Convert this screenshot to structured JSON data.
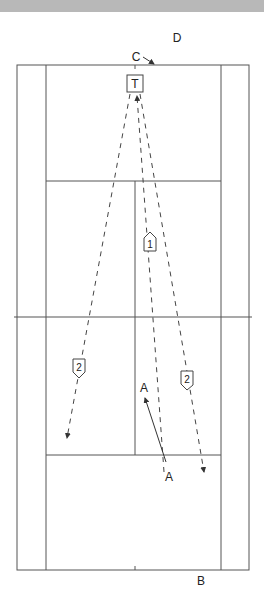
{
  "diagram": {
    "title_bar": "",
    "labels": {
      "D": "D",
      "C": "C",
      "T": "T",
      "A1": "A",
      "A2": "A",
      "B": "B"
    },
    "badges": {
      "b1": "1",
      "b2_left": "2",
      "b2_right": "2"
    }
  }
}
